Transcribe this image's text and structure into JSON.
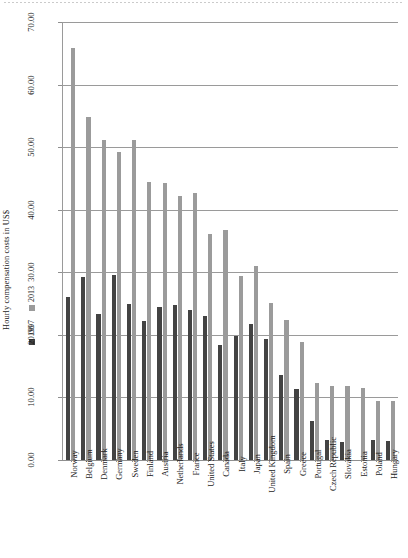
{
  "chart_data": {
    "type": "bar",
    "title": "",
    "ylabel": "Hourly compensation costs in US$",
    "xlabel": "",
    "ylim": [
      0,
      70
    ],
    "ytick_labels": [
      "0.00",
      "10.00",
      "20.00",
      "30.00",
      "40.00",
      "50.00",
      "60.00",
      "70.00"
    ],
    "ytick_values": [
      0,
      10,
      20,
      30,
      40,
      50,
      60,
      70
    ],
    "grid": "horizontal",
    "legend_position": "left-outside-vertical",
    "colors": {
      "series_1997": "#434343",
      "series_2013": "#9b9b9b",
      "gridline": "#9a9a9a"
    },
    "categories": [
      "Norway",
      "Belgium",
      "Denmark",
      "Germany",
      "Sweden",
      "Finland",
      "Austria",
      "Netherlands",
      "France",
      "United States",
      "Canada",
      "Italy",
      "Japan",
      "United Kingdom",
      "Spain",
      "Greece",
      "Portugal",
      "Czech Republic",
      "Slovakia",
      "Estonia",
      "Poland",
      "Hungary"
    ],
    "series": [
      {
        "name": "1997",
        "values": [
          26.0,
          29.3,
          23.4,
          29.5,
          25.0,
          22.2,
          24.5,
          24.8,
          24.0,
          23.0,
          18.4,
          19.8,
          21.8,
          19.4,
          13.6,
          11.4,
          6.3,
          3.2,
          2.8,
          null,
          3.2,
          3.0
        ]
      },
      {
        "name": "2013",
        "values": [
          65.8,
          54.8,
          51.2,
          49.2,
          51.1,
          44.5,
          44.2,
          42.2,
          42.6,
          36.2,
          36.8,
          29.4,
          31.0,
          25.1,
          22.3,
          18.8,
          12.3,
          11.9,
          11.9,
          11.5,
          9.5,
          9.4
        ]
      }
    ]
  },
  "axis": {
    "y_title": "Hourly compensation costs in US$"
  },
  "legend": {
    "items": [
      {
        "label": "1997",
        "color": "#434343"
      },
      {
        "label": "2013",
        "color": "#9b9b9b"
      }
    ]
  }
}
